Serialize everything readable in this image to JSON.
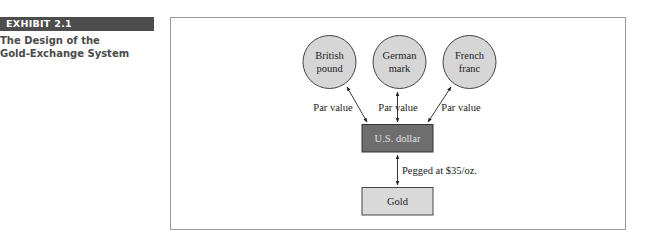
{
  "exhibit": {
    "label": "EXHIBIT 2.1",
    "title_line1": "The Design of the",
    "title_line2": "Gold-Exchange System"
  },
  "diagram": {
    "currencies": [
      {
        "line1": "British",
        "line2": "pound"
      },
      {
        "line1": "German",
        "line2": "mark"
      },
      {
        "line1": "French",
        "line2": "franc"
      }
    ],
    "par_labels": [
      "Par value",
      "Par value",
      "Par value"
    ],
    "center_node": "U.S. dollar",
    "peg_label": "Pegged at $35/oz.",
    "bottom_node": "Gold"
  },
  "colors": {
    "exhibit_bar": "#4d4d4d",
    "circle_fill": "#d6d6d6",
    "usd_box": "#6e6e6e",
    "gold_box": "#d9d9d9"
  }
}
